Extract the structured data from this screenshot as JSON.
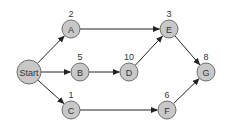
{
  "diagram": {
    "type": "directed-graph",
    "node_fill": "#c8c8c8",
    "node_stroke": "#6e6e6e",
    "edge_color": "#222222",
    "nodes": [
      {
        "id": "Start",
        "label": "Start",
        "weight": "",
        "x": 29,
        "y": 72,
        "r": 12
      },
      {
        "id": "A",
        "label": "A",
        "weight": "2",
        "x": 71,
        "y": 29,
        "r": 9
      },
      {
        "id": "B",
        "label": "B",
        "weight": "5",
        "x": 80,
        "y": 72,
        "r": 9
      },
      {
        "id": "C",
        "label": "C",
        "weight": "1",
        "x": 71,
        "y": 110,
        "r": 9
      },
      {
        "id": "D",
        "label": "D",
        "weight": "10",
        "x": 129,
        "y": 72,
        "r": 9
      },
      {
        "id": "E",
        "label": "E",
        "weight": "3",
        "x": 169,
        "y": 29,
        "r": 9
      },
      {
        "id": "F",
        "label": "F",
        "weight": "6",
        "x": 167,
        "y": 110,
        "r": 9
      },
      {
        "id": "G",
        "label": "G",
        "weight": "8",
        "x": 206,
        "y": 72,
        "r": 9
      }
    ],
    "edges": [
      {
        "from": "Start",
        "to": "A"
      },
      {
        "from": "Start",
        "to": "B"
      },
      {
        "from": "Start",
        "to": "C"
      },
      {
        "from": "A",
        "to": "E"
      },
      {
        "from": "B",
        "to": "D"
      },
      {
        "from": "D",
        "to": "E"
      },
      {
        "from": "C",
        "to": "F"
      },
      {
        "from": "E",
        "to": "G"
      },
      {
        "from": "F",
        "to": "G"
      }
    ]
  }
}
